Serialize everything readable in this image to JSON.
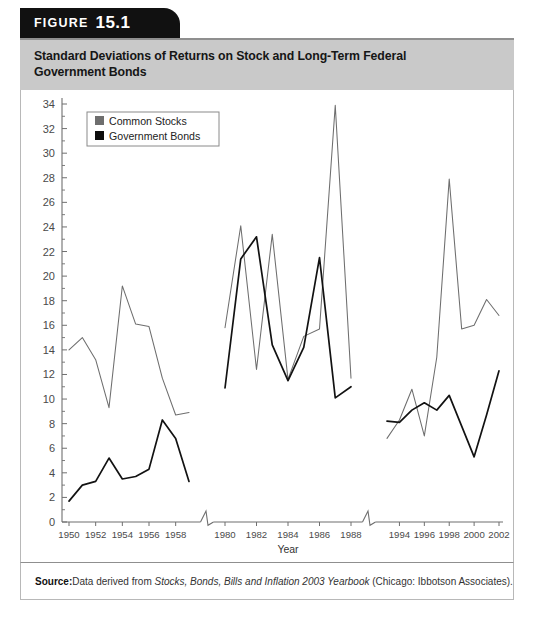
{
  "figure": {
    "tab_word": "FIGURE",
    "tab_number": "15.1",
    "title_line1": "Standard Deviations of Returns on Stock and Long-Term Federal",
    "title_line2": "Government Bonds"
  },
  "source": {
    "label": "Source:",
    "text_before": "Data derived from ",
    "italic_title": "Stocks, Bonds, Bills and Inflation 2003 Yearbook",
    "text_after": " (Chicago: Ibbotson Associates)."
  },
  "legend": {
    "items": [
      {
        "label": "Common Stocks",
        "color": "#6e6e6e"
      },
      {
        "label": "Government Bonds",
        "color": "#0d0d0d"
      }
    ]
  },
  "chart_data": {
    "type": "line",
    "title": "Standard Deviations of Returns on Stock and Long-Term Federal Government Bonds",
    "xlabel": "Year",
    "ylabel": "",
    "ylim": [
      0,
      34
    ],
    "ytick_step": 2,
    "yticks": [
      0,
      2,
      4,
      6,
      8,
      10,
      12,
      14,
      16,
      18,
      20,
      22,
      24,
      26,
      28,
      30,
      32,
      34
    ],
    "grid": false,
    "legend_position": "top-left",
    "axis_breaks": 2,
    "note": "X axis has two breaks; three era segments are plotted side by side.",
    "segments": [
      {
        "name": "1950s",
        "x": [
          1950,
          1951,
          1952,
          1953,
          1954,
          1955,
          1956,
          1957,
          1958,
          1959
        ],
        "xtick_labels": [
          "1950",
          "1952",
          "1954",
          "1956",
          "1958"
        ],
        "xticks": [
          1950,
          1952,
          1954,
          1956,
          1958
        ],
        "series": [
          {
            "name": "Common Stocks",
            "values": [
              14.0,
              15.0,
              13.2,
              9.3,
              19.2,
              16.1,
              15.9,
              11.7,
              8.7,
              8.9
            ]
          },
          {
            "name": "Government Bonds",
            "values": [
              1.7,
              3.0,
              3.3,
              5.2,
              3.5,
              3.7,
              4.3,
              8.3,
              6.8,
              3.3
            ]
          }
        ]
      },
      {
        "name": "1980s",
        "x": [
          1980,
          1981,
          1982,
          1983,
          1984,
          1985,
          1986,
          1987,
          1988
        ],
        "xtick_labels": [
          "1980",
          "1982",
          "1984",
          "1986",
          "1988"
        ],
        "xticks": [
          1980,
          1982,
          1984,
          1986,
          1988
        ],
        "series": [
          {
            "name": "Common Stocks",
            "values": [
              15.8,
              24.1,
              12.4,
              23.4,
              11.6,
              15.1,
              15.7,
              33.9,
              11.7
            ]
          },
          {
            "name": "Government Bonds",
            "values": [
              10.9,
              21.4,
              23.2,
              14.4,
              11.5,
              14.2,
              21.5,
              10.1,
              11.0
            ]
          }
        ]
      },
      {
        "name": "1990s-2000s",
        "x": [
          1993,
          1994,
          1995,
          1996,
          1997,
          1998,
          1999,
          2000,
          2001,
          2002
        ],
        "xtick_labels": [
          "1994",
          "1996",
          "1998",
          "2000",
          "2002"
        ],
        "xticks": [
          1994,
          1996,
          1998,
          2000,
          2002
        ],
        "series": [
          {
            "name": "Common Stocks",
            "values": [
              6.8,
              8.3,
              10.8,
              7.0,
              13.4,
              27.9,
              15.7,
              16.0,
              18.1,
              16.8
            ]
          },
          {
            "name": "Government Bonds",
            "values": [
              8.2,
              8.1,
              9.1,
              9.7,
              9.1,
              10.3,
              7.8,
              5.3,
              8.7,
              12.3
            ]
          }
        ]
      }
    ]
  }
}
